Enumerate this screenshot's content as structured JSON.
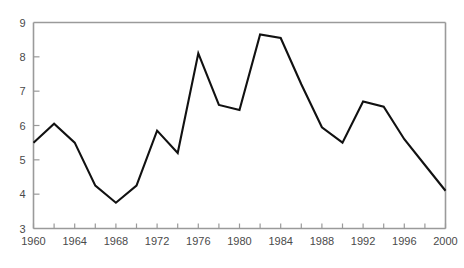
{
  "chart_data": {
    "type": "line",
    "title": "",
    "subtitle": "",
    "xlabel": "",
    "ylabel": "",
    "xlim": [
      1960,
      2000
    ],
    "ylim": [
      3,
      9
    ],
    "grid": false,
    "legend": null,
    "legend_position": "none",
    "line_color": "#111111",
    "axis_color": "#9a9a9a",
    "x_tick_interval": 2,
    "x_label_interval": 4,
    "y_tick_interval": 1,
    "x": [
      1960,
      1962,
      1964,
      1966,
      1968,
      1970,
      1972,
      1974,
      1976,
      1978,
      1980,
      1982,
      1984,
      1986,
      1988,
      1990,
      1992,
      1994,
      1996,
      1998,
      2000
    ],
    "values": [
      5.5,
      6.05,
      5.5,
      4.25,
      3.75,
      4.25,
      5.85,
      5.2,
      8.1,
      6.6,
      6.45,
      8.65,
      8.55,
      7.2,
      5.95,
      5.5,
      6.7,
      6.55,
      5.6,
      4.85,
      4.1
    ],
    "x_tick_values": [
      1960,
      1962,
      1964,
      1966,
      1968,
      1970,
      1972,
      1974,
      1976,
      1978,
      1980,
      1982,
      1984,
      1986,
      1988,
      1990,
      1992,
      1994,
      1996,
      1998,
      2000
    ],
    "x_tick_labels": [
      "1960",
      "",
      "1964",
      "",
      "1968",
      "",
      "1972",
      "",
      "1976",
      "",
      "1980",
      "",
      "1984",
      "",
      "1988",
      "",
      "1992",
      "",
      "1996",
      "",
      "2000"
    ],
    "y_tick_values": [
      3,
      4,
      5,
      6,
      7,
      8,
      9
    ],
    "y_tick_labels": [
      "3",
      "4",
      "5",
      "6",
      "7",
      "8",
      "9"
    ],
    "annotations": []
  }
}
